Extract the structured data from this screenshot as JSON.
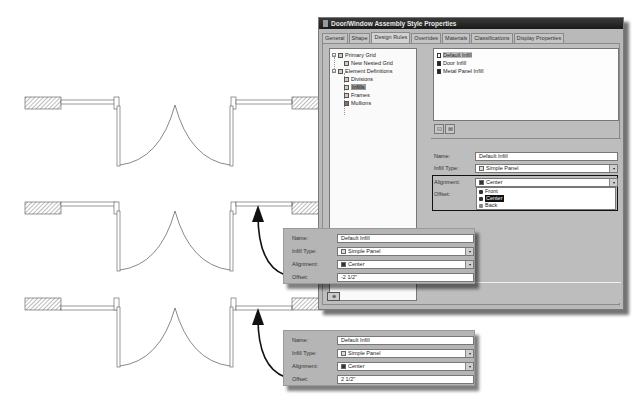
{
  "dialog": {
    "title": "Door/Window Assembly Style Properties",
    "tabs": [
      {
        "label": "General",
        "active": false
      },
      {
        "label": "Shape",
        "active": false
      },
      {
        "label": "Design Rules",
        "active": true
      },
      {
        "label": "Overrides",
        "active": false
      },
      {
        "label": "Materials",
        "active": false
      },
      {
        "label": "Classifications",
        "active": false
      },
      {
        "label": "Display Properties",
        "active": false
      }
    ],
    "tree": {
      "items": [
        {
          "label": "Primary Grid",
          "level": 0,
          "icon": "grid-icon",
          "expander": "-"
        },
        {
          "label": "New Nested Grid",
          "level": 1,
          "icon": "nested-grid-icon"
        },
        {
          "label": "Element Definitions",
          "level": 0,
          "icon": "folder-icon",
          "expander": "-"
        },
        {
          "label": "Divisions",
          "level": 1,
          "icon": "divisions-icon"
        },
        {
          "label": "Infills",
          "level": 1,
          "icon": "infills-icon",
          "selected": true
        },
        {
          "label": "Frames",
          "level": 1,
          "icon": "frames-icon"
        },
        {
          "label": "Mullions",
          "level": 1,
          "icon": "mullions-icon"
        }
      ]
    },
    "infill_list": {
      "items": [
        {
          "label": "Default Infill",
          "icon": "panel-icon",
          "selected": true
        },
        {
          "label": "Door Infill",
          "icon": "door-icon"
        },
        {
          "label": "Metal Panel Infill",
          "icon": "metal-panel-icon"
        }
      ],
      "buttons": [
        {
          "name": "new-infill-button",
          "glyph": "⊡"
        },
        {
          "name": "delete-infill-button",
          "glyph": "⊠"
        }
      ]
    },
    "properties": {
      "name_label": "Name:",
      "name_value": "Default Infill",
      "infill_type_label": "Infill Type:",
      "infill_type_value": "Simple Panel",
      "alignment_label": "Alignment:",
      "alignment_value": "Center",
      "offset_label": "Offset:",
      "alignment_options": [
        {
          "label": "Front",
          "selected": false
        },
        {
          "label": "Center",
          "selected": true
        },
        {
          "label": "Back",
          "selected": false
        }
      ]
    }
  },
  "callouts": [
    {
      "name_label": "Name:",
      "name_value": "Default Infill",
      "infill_type_label": "Infill Type:",
      "infill_type_value": "Simple Panel",
      "alignment_label": "Alignment:",
      "alignment_value": "Center",
      "offset_label": "Offset:",
      "offset_value": "-2 1/2\""
    },
    {
      "name_label": "Name:",
      "name_value": "Default Infill",
      "infill_type_label": "Infill Type:",
      "infill_type_value": "Simple Panel",
      "alignment_label": "Alignment:",
      "alignment_value": "Center",
      "offset_label": "Offset:",
      "offset_value": "2 1/2\""
    }
  ],
  "icons": {
    "dropdown_arrow": "▾",
    "minus": "−"
  },
  "colors": {
    "titlebar": "#222222",
    "dialog_bg": "#b9b9b9",
    "selection": "#111111"
  }
}
